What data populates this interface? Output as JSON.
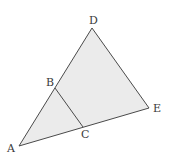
{
  "diagram": {
    "fill_color": "#ebebeb",
    "stroke_color": "#4a4a4a",
    "points": {
      "A": {
        "label": "A",
        "x": 19,
        "y": 146
      },
      "B": {
        "label": "B",
        "x": 55,
        "y": 88
      },
      "C": {
        "label": "C",
        "x": 83,
        "y": 127
      },
      "D": {
        "label": "D",
        "x": 92,
        "y": 28
      },
      "E": {
        "label": "E",
        "x": 149,
        "y": 108
      }
    },
    "triangle": [
      "A",
      "D",
      "E"
    ],
    "segment": [
      "B",
      "C"
    ]
  }
}
